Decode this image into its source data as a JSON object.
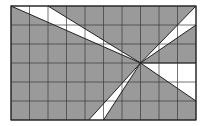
{
  "diagram": {
    "type": "shaded-grid",
    "grid": {
      "columns": 10,
      "rows": 6,
      "x0": 11,
      "y0": 6,
      "x1": 196,
      "y1": 120
    },
    "colors": {
      "shade": "#9a9a9a",
      "white": "#ffffff",
      "line": "#3a3a3a"
    },
    "center": {
      "col": 7,
      "row": 3
    },
    "white_regions": [
      {
        "name": "top-wedge",
        "points": [
          [
            0,
            0
          ],
          [
            2,
            0
          ],
          [
            7,
            3
          ]
        ]
      },
      {
        "name": "top-right-wedge",
        "points": [
          [
            10,
            0
          ],
          [
            10,
            1
          ],
          [
            7,
            3
          ]
        ]
      },
      {
        "name": "bottom-wedge",
        "points": [
          [
            4.2,
            6
          ],
          [
            5,
            6
          ],
          [
            7,
            3
          ]
        ]
      },
      {
        "name": "right-wedge",
        "points": [
          [
            7,
            3
          ],
          [
            10,
            3
          ],
          [
            10,
            5
          ]
        ]
      }
    ]
  }
}
